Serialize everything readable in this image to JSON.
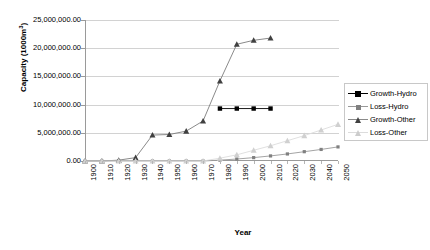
{
  "chart_data": {
    "type": "line",
    "title": "",
    "xlabel": "Year",
    "ylabel": "Capacity (1000m3)",
    "ylabel_html": "Capacity (1000m<sup>3</sup>)",
    "x": [
      1900,
      1910,
      1920,
      1930,
      1940,
      1950,
      1960,
      1970,
      1980,
      1990,
      2000,
      2010,
      2020,
      2030,
      2040,
      2050
    ],
    "xlim": [
      1900,
      2050
    ],
    "ylim": [
      0,
      25000000
    ],
    "yticks": [
      0,
      5000000,
      10000000,
      15000000,
      20000000,
      25000000
    ],
    "ytick_labels": [
      "0.00",
      "5,000,000.00",
      "10,000,000.00",
      "15,000,000.00",
      "20,000,000.00",
      "25,000,000.00"
    ],
    "xtick_labels": [
      "1900",
      "1910",
      "1920",
      "1930",
      "1940",
      "1950",
      "1960",
      "1970",
      "1980",
      "1990",
      "2000",
      "2010",
      "2020",
      "2030",
      "2040",
      "2050"
    ],
    "grid": true,
    "legend_position": "right",
    "series": [
      {
        "name": "Growth-Hydro",
        "color": "#000000",
        "marker": "square",
        "x": [
          1980,
          1990,
          2000,
          2010
        ],
        "values": [
          9300000,
          9300000,
          9300000,
          9300000
        ]
      },
      {
        "name": "Loss-Hydro",
        "color": "#808080",
        "marker": "square",
        "x": [
          1900,
          1910,
          1920,
          1930,
          1940,
          1950,
          1960,
          1970,
          1980,
          1990,
          2000,
          2010,
          2020,
          2030,
          2040,
          2050
        ],
        "values": [
          0,
          0,
          0,
          0,
          0,
          0,
          0,
          0,
          150000,
          350000,
          600000,
          900000,
          1250000,
          1650000,
          2050000,
          2500000
        ]
      },
      {
        "name": "Growth-Other",
        "color": "#404040",
        "marker": "triangle",
        "x": [
          1900,
          1910,
          1920,
          1930,
          1940,
          1950,
          1960,
          1970,
          1980,
          1990,
          2000,
          2010
        ],
        "values": [
          0,
          0,
          150000,
          600000,
          4600000,
          4700000,
          5300000,
          7100000,
          14200000,
          20700000,
          21400000,
          21800000
        ]
      },
      {
        "name": "Loss-Other",
        "color": "#d0d0d0",
        "marker": "triangle",
        "x": [
          1900,
          1910,
          1920,
          1930,
          1940,
          1950,
          1960,
          1970,
          1980,
          1990,
          2000,
          2010,
          2020,
          2030,
          2040,
          2050
        ],
        "values": [
          0,
          0,
          0,
          0,
          0,
          0,
          0,
          0,
          500000,
          1100000,
          1900000,
          2700000,
          3600000,
          4500000,
          5500000,
          6500000
        ]
      }
    ]
  },
  "legend": {
    "items": [
      {
        "label": "Growth-Hydro"
      },
      {
        "label": "Loss-Hydro"
      },
      {
        "label": "Growth-Other"
      },
      {
        "label": "Loss-Other"
      }
    ]
  },
  "axes": {
    "x_title": "Year",
    "y_title": "Capacity (1000m3)"
  }
}
